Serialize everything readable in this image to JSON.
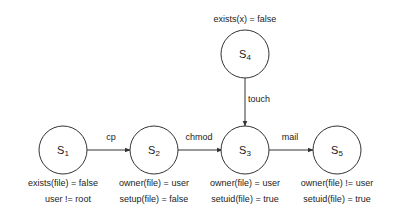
{
  "states": [
    {
      "id": "S1",
      "name": "S",
      "sub": "1",
      "conditions": [
        "exists(file) = false",
        "user != root"
      ]
    },
    {
      "id": "S2",
      "name": "S",
      "sub": "2",
      "conditions": [
        "owner(file) = user",
        "setup(file) = false"
      ]
    },
    {
      "id": "S3",
      "name": "S",
      "sub": "3",
      "conditions": [
        "owner(file) = user",
        "setuid(file) = true"
      ]
    },
    {
      "id": "S4",
      "name": "S",
      "sub": "4",
      "conditions": [
        "exists(x) = false"
      ]
    },
    {
      "id": "S5",
      "name": "S",
      "sub": "5",
      "conditions": [
        "owner(file) != user",
        "setuid(file) = true"
      ]
    }
  ],
  "transitions": [
    {
      "from": "S1",
      "to": "S2",
      "label": "cp"
    },
    {
      "from": "S2",
      "to": "S3",
      "label": "chmod"
    },
    {
      "from": "S4",
      "to": "S3",
      "label": "touch"
    },
    {
      "from": "S3",
      "to": "S5",
      "label": "mail"
    }
  ]
}
